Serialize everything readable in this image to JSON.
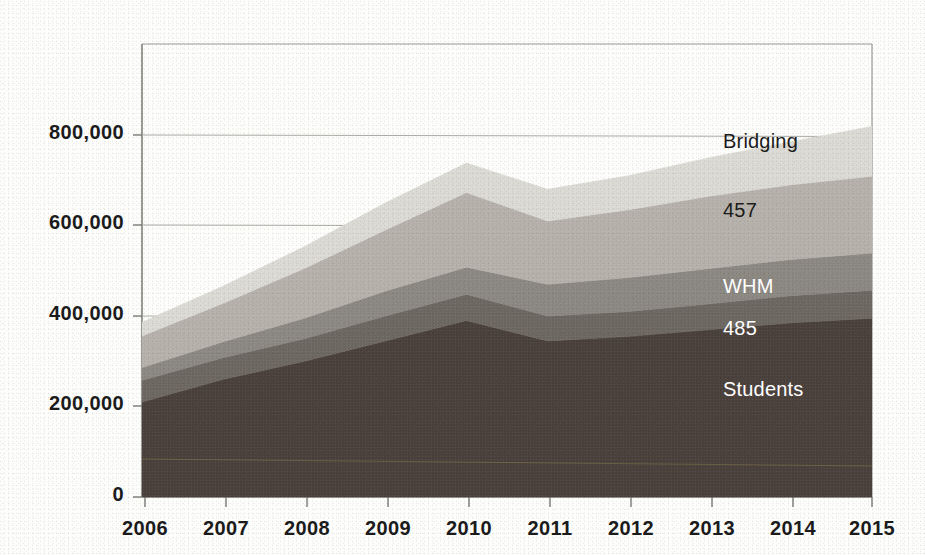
{
  "chart_data": {
    "type": "area",
    "title": "",
    "subtitle": "",
    "xlabel": "",
    "ylabel": "",
    "stacked": true,
    "grid": true,
    "legend_position": "inline-band-labels",
    "categories": [
      "2006",
      "2007",
      "2008",
      "2009",
      "2010",
      "2011",
      "2012",
      "2013",
      "2014",
      "2015"
    ],
    "x": [
      2006,
      2007,
      2008,
      2009,
      2010,
      2011,
      2012,
      2013,
      2014,
      2015
    ],
    "xlim": [
      2006,
      2015
    ],
    "ylim": [
      0,
      1000000
    ],
    "ytick_labels": [
      "0",
      "200,000",
      "400,000",
      "600,000",
      "800,000"
    ],
    "ytick_values": [
      0,
      200000,
      400000,
      600000,
      800000
    ],
    "series": [
      {
        "name": "Students",
        "color": "#4b413c",
        "label_color": "#ffffff",
        "values": [
          210000,
          260000,
          300000,
          345000,
          390000,
          345000,
          355000,
          370000,
          385000,
          395000
        ]
      },
      {
        "name": "485",
        "color": "#6e6862",
        "label_color": "#ffffff",
        "values": [
          48000,
          48000,
          50000,
          55000,
          58000,
          55000,
          55000,
          57000,
          60000,
          62000
        ]
      },
      {
        "name": "WHM",
        "color": "#8c8882",
        "label_color": "#ffffff",
        "values": [
          28000,
          35000,
          45000,
          55000,
          60000,
          70000,
          75000,
          78000,
          80000,
          82000
        ]
      },
      {
        "name": "457",
        "color": "#b6b2ab",
        "label_color": "#1b1b1b",
        "values": [
          70000,
          85000,
          110000,
          135000,
          165000,
          140000,
          150000,
          160000,
          165000,
          170000
        ]
      },
      {
        "name": "Bridging",
        "color": "#dcdad4",
        "label_color": "#1b1b1b",
        "values": [
          30000,
          38000,
          48000,
          60000,
          65000,
          70000,
          75000,
          85000,
          95000,
          110000
        ]
      }
    ],
    "band_labels": [
      {
        "text": "Bridging",
        "x": 723,
        "y": 143,
        "tone": "dark"
      },
      {
        "text": "457",
        "x": 723,
        "y": 212,
        "tone": "dark"
      },
      {
        "text": "WHM",
        "x": 723,
        "y": 288,
        "tone": "light"
      },
      {
        "text": "485",
        "x": 723,
        "y": 330,
        "tone": "light"
      },
      {
        "text": "Students",
        "x": 723,
        "y": 391,
        "tone": "light"
      }
    ]
  },
  "axis": {
    "y_ticks": [
      {
        "label": "800,000",
        "y": 135
      },
      {
        "label": "600,000",
        "y": 225
      },
      {
        "label": "400,000",
        "y": 316
      },
      {
        "label": "200,000",
        "y": 406
      },
      {
        "label": "0",
        "y": 497
      }
    ],
    "x_ticks": [
      {
        "label": "2006",
        "x": 145
      },
      {
        "label": "2007",
        "x": 226
      },
      {
        "label": "2008",
        "x": 307
      },
      {
        "label": "2009",
        "x": 388
      },
      {
        "label": "2010",
        "x": 469
      },
      {
        "label": "2011",
        "x": 550
      },
      {
        "label": "2012",
        "x": 631
      },
      {
        "label": "2013",
        "x": 712
      },
      {
        "label": "2014",
        "x": 793
      },
      {
        "label": "2015",
        "x": 872
      }
    ]
  },
  "colors": {
    "background": "#fdfdfb",
    "axis_line": "#9a9a94",
    "grid_line": "#a8a8a2",
    "text": "#1b1b1b"
  }
}
